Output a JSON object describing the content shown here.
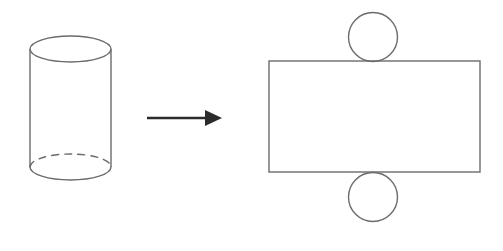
{
  "figure": {
    "title": "Cylinder and its net",
    "background_color": "#ffffff",
    "shape_stroke_color": "#6b6b6b",
    "arrow_color": "#2b2b2b",
    "shape_stroke_width": 1.4,
    "arrow_stroke_width": 2.4,
    "cylinder": {
      "label": "cylinder",
      "center_x": 70.5,
      "radius_x": 40.5,
      "top_center_y": 49,
      "bottom_center_y": 167,
      "ellipse_radius_y": 13,
      "top_ellipse_style": "solid",
      "bottom_front_arc_style": "solid",
      "bottom_back_arc_style": "dashed",
      "dash_pattern": "7 6",
      "left_wall_x": 30,
      "right_wall_x": 111,
      "wall_top_y": 49,
      "wall_bottom_y": 167
    },
    "arrow": {
      "label": "transformation-arrow",
      "direction": "right",
      "start_x": 147,
      "end_x": 222,
      "y": 118,
      "head_length": 17,
      "head_half_height": 8
    },
    "net": {
      "label": "cylinder-net",
      "rectangle": {
        "label": "lateral-surface-rectangle",
        "x": 269,
        "y": 61,
        "width": 211,
        "height": 111
      },
      "top_circle": {
        "label": "top-base-circle",
        "center_x": 373,
        "center_y": 37,
        "radius": 24.5
      },
      "bottom_circle": {
        "label": "bottom-base-circle",
        "center_x": 373,
        "center_y": 197,
        "radius": 24.5
      }
    }
  }
}
